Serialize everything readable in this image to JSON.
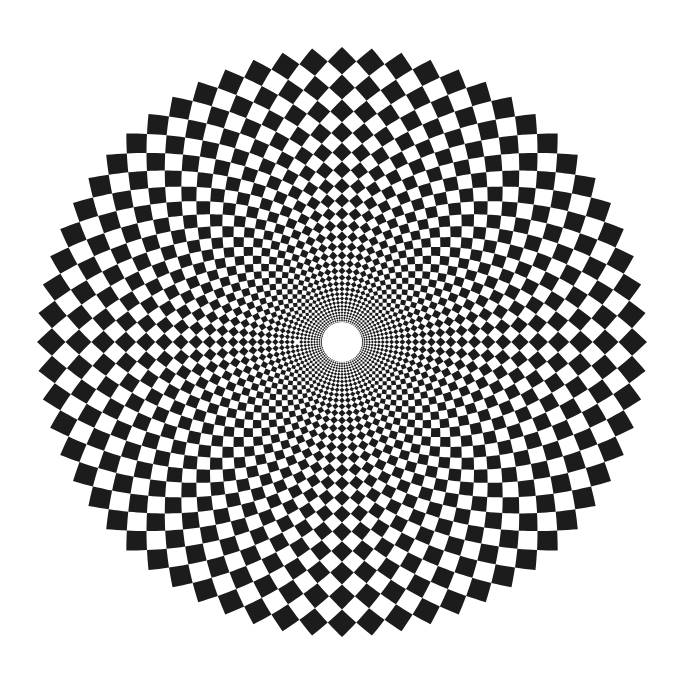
{
  "artwork": {
    "title": "Log-polar checkerboard spiral",
    "description": "Op-art pattern of black and white diamond tiles arranged along two opposing families of equiangular spirals, shrinking toward a white central hole",
    "colors": {
      "background": "#ffffff",
      "tile_dark": "#1c1c1c",
      "tile_light": "#ffffff",
      "center_hole": "#ffffff"
    },
    "pattern": {
      "dark_tiles_per_ring": 32,
      "spiral_angle_deg": 45,
      "rings_visible": 14,
      "symmetry": "4-fold, dark tip at top, bottom, left and right"
    }
  }
}
